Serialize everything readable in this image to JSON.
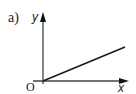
{
  "figure": {
    "part_label": "a)",
    "y_axis_label": "y",
    "x_axis_label": "x",
    "origin_label": "O",
    "graph_description": "straight line through origin with positive slope"
  },
  "colors": {
    "axis": "#444444",
    "line": "#1a1a1a",
    "text": "#222222"
  }
}
